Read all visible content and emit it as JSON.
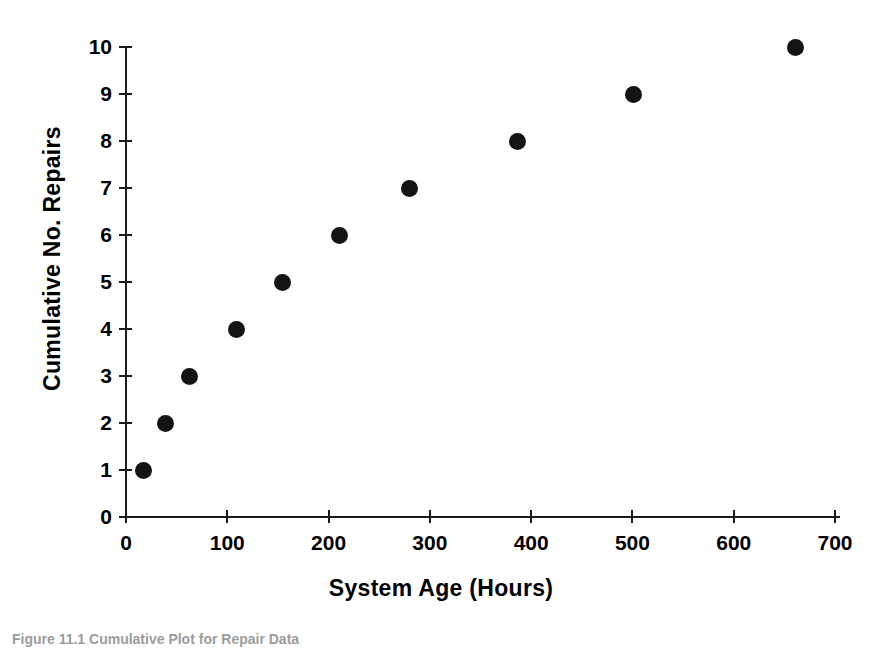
{
  "figure": {
    "caption": "Figure 11.1 Cumulative Plot for Repair Data"
  },
  "chart_data": {
    "type": "scatter",
    "title": "",
    "xlabel": "System Age (Hours)",
    "ylabel": "Cumulative No. Repairs",
    "xlim": [
      0,
      700
    ],
    "ylim": [
      0,
      10
    ],
    "grid": false,
    "legend": "none",
    "marker": "filled-circle",
    "marker_color": "#141414",
    "xticks": [
      0,
      100,
      200,
      300,
      400,
      500,
      600,
      700
    ],
    "xtick_labels": [
      "0",
      "100",
      "200",
      "300",
      "400",
      "500",
      "600",
      "700"
    ],
    "yticks": [
      0,
      1,
      2,
      3,
      4,
      5,
      6,
      7,
      8,
      9,
      10
    ],
    "ytick_labels": [
      "0",
      "1",
      "2",
      "3",
      "4",
      "5",
      "6",
      "7",
      "8",
      "9",
      "10"
    ],
    "x": [
      17,
      39,
      63,
      109,
      155,
      211,
      280,
      387,
      501,
      661
    ],
    "y": [
      1,
      2,
      3,
      4,
      5,
      6,
      7,
      8,
      9,
      10
    ],
    "points": [
      {
        "x": 17,
        "y": 1
      },
      {
        "x": 39,
        "y": 2
      },
      {
        "x": 63,
        "y": 3
      },
      {
        "x": 109,
        "y": 4
      },
      {
        "x": 155,
        "y": 5
      },
      {
        "x": 211,
        "y": 6
      },
      {
        "x": 280,
        "y": 7
      },
      {
        "x": 387,
        "y": 8
      },
      {
        "x": 501,
        "y": 9
      },
      {
        "x": 661,
        "y": 10
      }
    ]
  }
}
